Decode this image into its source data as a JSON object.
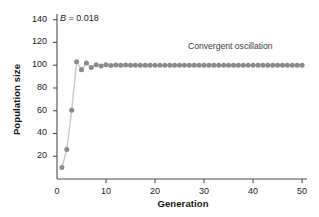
{
  "chart_data": {
    "type": "scatter",
    "title": "",
    "xlabel": "Generation",
    "ylabel": "Population size",
    "xlim": [
      0,
      51
    ],
    "ylim": [
      0,
      145
    ],
    "xticks": [
      0,
      10,
      20,
      30,
      40,
      50
    ],
    "yticks": [
      20,
      40,
      60,
      80,
      100,
      120,
      140
    ],
    "grid": false,
    "legend": "none",
    "marker_color": "#8a8a8a",
    "line_color": "#c9c9c9",
    "axis_color": "#4d4d4d",
    "annotations": [
      {
        "name": "b-parameter",
        "text_prefix": "B",
        "text_suffix": " = 0.018",
        "x": 1.5,
        "y": 140
      },
      {
        "name": "convergent-oscillation",
        "text": "Convergent oscillation",
        "x": 29,
        "y": 117
      }
    ],
    "series": [
      {
        "name": "population",
        "x": [
          1,
          2,
          3,
          4,
          5,
          6,
          7,
          8,
          9,
          10,
          11,
          12,
          13,
          14,
          15,
          16,
          17,
          18,
          19,
          20,
          21,
          22,
          23,
          24,
          25,
          26,
          27,
          28,
          29,
          30,
          31,
          32,
          33,
          34,
          35,
          36,
          37,
          38,
          39,
          40,
          41,
          42,
          43,
          44,
          45,
          46,
          47,
          48,
          49,
          50
        ],
        "values": [
          10,
          26,
          60.5,
          103,
          96,
          102,
          98,
          100.5,
          99.2,
          100.3,
          99.7,
          100.2,
          99.9,
          100.1,
          99.95,
          100.05,
          100,
          100,
          100,
          100,
          100,
          100,
          100,
          100,
          100,
          100,
          100,
          100,
          100,
          100,
          100,
          100,
          100,
          100,
          100,
          100,
          100,
          100,
          100,
          100,
          100,
          100,
          100,
          100,
          100,
          100,
          100,
          100,
          100,
          100
        ]
      }
    ]
  },
  "figure": {
    "b_label_prefix": "B",
    "b_label_suffix": " = 0.018",
    "annotation_text": "Convergent oscillation",
    "axis_x_title": "Generation",
    "axis_y_title": "Population size"
  }
}
